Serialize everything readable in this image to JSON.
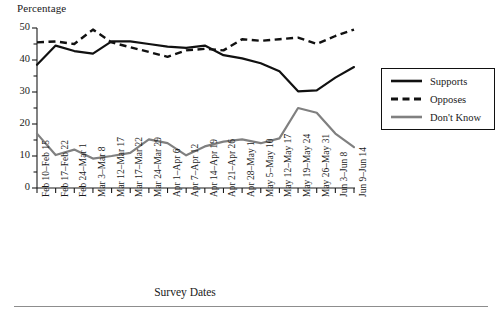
{
  "chart_data": {
    "type": "line",
    "title": "",
    "xlabel": "Survey Dates",
    "ylabel": "Percentage",
    "ylim": [
      0,
      50
    ],
    "yticks": [
      0,
      10,
      20,
      30,
      40,
      50
    ],
    "yminorticks": [
      5,
      15,
      25,
      35,
      45
    ],
    "grid": false,
    "legend_position": "right-outside",
    "categories": [
      "Feb 10–Feb 15",
      "Feb 17–Feb 22",
      "Feb 24–Mar 1",
      "Mar 3–Mar 8",
      "Mar 12–Mar 17",
      "Mar 17–Mar 22",
      "Mar 24–Mar 29",
      "Apr 1–Apr 6",
      "Apr 7–Apr 12",
      "Apr 14–Apr 19",
      "Apr 21–Apr 26",
      "Apr 28–May 1",
      "May 5–May 10",
      "May 12–May 17",
      "May 19–May 24",
      "May 26–May 31",
      "Jun 3–Jun 8",
      "Jun 9–Jun 14"
    ],
    "series": [
      {
        "name": "Supports",
        "color": "#111111",
        "style": "solid",
        "values": [
          38.5,
          44.5,
          42.8,
          42.0,
          45.8,
          45.8,
          45.0,
          44.2,
          43.8,
          44.5,
          41.5,
          40.5,
          39.0,
          36.5,
          30.2,
          30.5,
          34.5,
          37.8
        ]
      },
      {
        "name": "Opposes",
        "color": "#111111",
        "style": "dashed",
        "values": [
          45.5,
          45.8,
          45.0,
          49.5,
          45.5,
          44.0,
          42.5,
          41.0,
          43.0,
          43.5,
          43.0,
          46.5,
          46.0,
          46.5,
          47.0,
          45.0,
          47.5,
          49.5
        ]
      },
      {
        "name": "Don't Know",
        "color": "#808080",
        "style": "solid",
        "values": [
          17.0,
          10.3,
          12.0,
          9.2,
          10.0,
          11.0,
          15.2,
          14.0,
          10.2,
          13.0,
          14.5,
          15.2,
          14.0,
          15.5,
          25.0,
          23.5,
          17.0,
          12.8
        ]
      }
    ]
  },
  "legend": {
    "items": [
      {
        "label": "Supports"
      },
      {
        "label": "Opposes"
      },
      {
        "label": "Don't Know"
      }
    ]
  }
}
